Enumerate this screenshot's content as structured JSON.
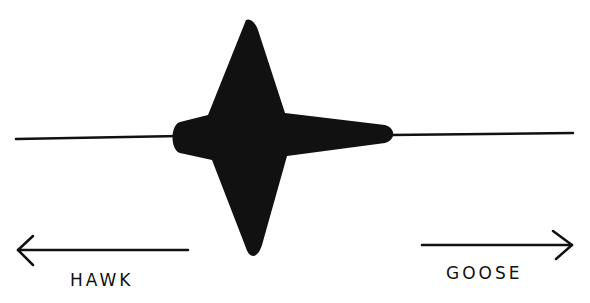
{
  "figure": {
    "left_label": "HAWK",
    "right_label": "GOOSE",
    "left_arrow": "arrow-left",
    "right_arrow": "arrow-right",
    "colors": {
      "ink": "#111111",
      "background": "#ffffff"
    }
  }
}
